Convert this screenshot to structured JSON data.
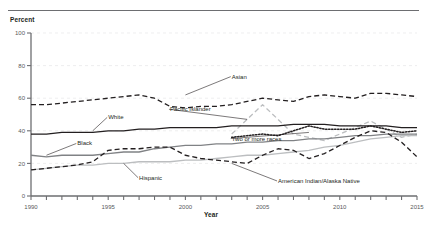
{
  "figure": {
    "y_axis_title": "Percent",
    "x_axis_title": "Year"
  },
  "chart_data": {
    "type": "line",
    "title": "",
    "subtitle": "",
    "xlabel": "Year",
    "ylabel": "Percent",
    "xlim": [
      1990,
      2015
    ],
    "ylim": [
      0,
      100
    ],
    "yticks": [
      0,
      20,
      40,
      60,
      80,
      100
    ],
    "ytick_labels": [
      "0",
      "20",
      "40",
      "60",
      "80",
      "100"
    ],
    "xticks": [
      1990,
      1991,
      1992,
      1993,
      1994,
      1995,
      1996,
      1997,
      1998,
      1999,
      2000,
      2001,
      2002,
      2003,
      2004,
      2005,
      2006,
      2007,
      2008,
      2009,
      2010,
      2011,
      2012,
      2013,
      2014,
      2015
    ],
    "xtick_labels_shown": [
      "1990",
      "1995",
      "2000",
      "2005",
      "2010",
      "2015"
    ],
    "grid": "horizontal-dashed-faint",
    "legend": "inline-annotations",
    "x": [
      1990,
      1991,
      1992,
      1993,
      1994,
      1995,
      1996,
      1997,
      1998,
      1999,
      2000,
      2001,
      2002,
      2003,
      2004,
      2005,
      2006,
      2007,
      2008,
      2009,
      2010,
      2011,
      2012,
      2013,
      2014,
      2015
    ],
    "series": [
      {
        "name": "Asian",
        "label": "Asian",
        "style": "dashed",
        "color": "#231f20",
        "values": [
          56,
          56,
          57,
          58,
          59,
          60,
          61,
          62,
          60,
          55,
          54,
          55,
          55,
          56,
          58,
          60,
          59,
          58,
          61,
          62,
          61,
          60,
          63,
          63,
          62,
          61
        ]
      },
      {
        "name": "Pacific Islander",
        "label": "Pacific Islander",
        "style": "dashed",
        "color": "#bcbec0",
        "values": [
          null,
          null,
          null,
          null,
          null,
          null,
          null,
          null,
          null,
          null,
          null,
          null,
          null,
          38,
          47,
          56,
          47,
          38,
          36,
          34,
          38,
          42,
          46,
          41,
          36,
          38
        ]
      },
      {
        "name": "White",
        "label": "White",
        "style": "solid",
        "color": "#231f20",
        "values": [
          38,
          38,
          39,
          39,
          39,
          40,
          40,
          41,
          41,
          42,
          42,
          42,
          42,
          43,
          43,
          43,
          43,
          44,
          44,
          44,
          43,
          43,
          43,
          43,
          42,
          42
        ]
      },
      {
        "name": "Two or more races",
        "label": "Two or more races",
        "style": "dotted",
        "color": "#231f20",
        "values": [
          null,
          null,
          null,
          null,
          null,
          null,
          null,
          null,
          null,
          null,
          null,
          null,
          null,
          36,
          37,
          38,
          37,
          40,
          43,
          41,
          41,
          41,
          43,
          41,
          39,
          40
        ]
      },
      {
        "name": "Black",
        "label": "Black",
        "style": "solid",
        "color": "#808285",
        "values": [
          25,
          24,
          25,
          25,
          25,
          26,
          27,
          27,
          29,
          30,
          31,
          31,
          32,
          32,
          33,
          33,
          34,
          34,
          35,
          35,
          36,
          37,
          37,
          38,
          38,
          38
        ]
      },
      {
        "name": "Hispanic",
        "label": "Hispanic",
        "style": "solid",
        "color": "#bcbec0",
        "values": [
          16,
          17,
          18,
          19,
          19,
          20,
          20,
          21,
          21,
          21,
          22,
          22,
          23,
          24,
          25,
          25,
          26,
          27,
          28,
          30,
          31,
          33,
          35,
          36,
          37,
          37
        ]
      },
      {
        "name": "American Indian/Alaska Native",
        "label": "American Indian/Alaska Native",
        "style": "dashed",
        "color": "#231f20",
        "values": [
          16,
          17,
          18,
          19,
          21,
          28,
          29,
          29,
          30,
          30,
          25,
          23,
          22,
          21,
          20,
          25,
          29,
          28,
          23,
          26,
          31,
          36,
          40,
          39,
          33,
          24
        ]
      }
    ],
    "annotations": [
      {
        "text": "Asian",
        "x": 2003,
        "y": 72
      },
      {
        "text": "Pacific Islander",
        "x": 1999,
        "y": 52
      },
      {
        "text": "White",
        "x": 1995,
        "y": 47
      },
      {
        "text": "Two or more races",
        "x": 2003,
        "y": 34
      },
      {
        "text": "Black",
        "x": 1993,
        "y": 31
      },
      {
        "text": "Hispanic",
        "x": 1997,
        "y": 10
      },
      {
        "text": "American Indian/Alaska Native",
        "x": 2006,
        "y": 8
      }
    ]
  }
}
